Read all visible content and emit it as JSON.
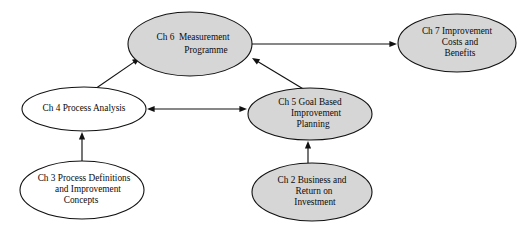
{
  "diagram": {
    "background_color": "#ffffff",
    "filled_color": "#d6d6d6",
    "unfilled_color": "#ffffff",
    "stroke_color": "#111111",
    "nodes": [
      {
        "id": "ch6",
        "name": "ch6-measurement-programme",
        "fill": "filled",
        "cx": 190,
        "cy": 44,
        "rx": 62,
        "ry": 32,
        "lines": [
          "Ch 6  Measurement",
          "Programme"
        ],
        "line_offsets": [
          -6,
          7
        ],
        "line_anchors": [
          193,
          206
        ]
      },
      {
        "id": "ch7",
        "name": "ch7-improvement-costs-and-benefits",
        "fill": "filled",
        "cx": 457,
        "cy": 43,
        "rx": 59,
        "ry": 29,
        "lines": [
          "Ch 7 Improvement",
          "Costs and",
          "Benefits"
        ],
        "line_offsets": [
          -11,
          0,
          11
        ],
        "line_anchors": [
          457,
          460,
          460
        ]
      },
      {
        "id": "ch4",
        "name": "ch4-process-analysis",
        "fill": "unfilled",
        "cx": 84,
        "cy": 109,
        "rx": 62,
        "ry": 22,
        "lines": [
          "Ch 4 Process Analysis"
        ],
        "line_offsets": [
          0
        ],
        "line_anchors": [
          84
        ]
      },
      {
        "id": "ch5",
        "name": "ch5-goal-based-improvement-planning",
        "fill": "filled",
        "cx": 310,
        "cy": 114,
        "rx": 62,
        "ry": 26,
        "lines": [
          "Ch 5 Goal Based",
          "Improvement",
          "Planning"
        ],
        "line_offsets": [
          -11,
          0,
          11
        ],
        "line_anchors": [
          310,
          316,
          313
        ]
      },
      {
        "id": "ch3",
        "name": "ch3-process-definitions-and-improvement-concepts",
        "fill": "unfilled",
        "cx": 82,
        "cy": 190,
        "rx": 62,
        "ry": 29,
        "lines": [
          "Ch 3 Process Definitions",
          "and Improvement",
          "Concepts"
        ],
        "line_offsets": [
          -11,
          0,
          11
        ],
        "line_anchors": [
          84,
          88,
          81
        ]
      },
      {
        "id": "ch2",
        "name": "ch2-business-and-return-on-investment",
        "fill": "filled",
        "cx": 312,
        "cy": 192,
        "rx": 60,
        "ry": 29,
        "lines": [
          "Ch 2 Business and",
          "Return on",
          "Investment"
        ],
        "line_offsets": [
          -11,
          0,
          11
        ],
        "line_anchors": [
          312,
          314,
          315
        ]
      }
    ],
    "edges": [
      {
        "id": "edge-ch4-to-ch6",
        "name": "edge-ch4-to-ch6",
        "from": "ch4",
        "to": "ch6",
        "arrows": "end",
        "x1": 92,
        "y1": 91,
        "x2": 140,
        "y2": 58
      },
      {
        "id": "edge-ch6-to-ch7",
        "name": "edge-ch6-to-ch7",
        "from": "ch6",
        "to": "ch7",
        "arrows": "end",
        "x1": 252,
        "y1": 44,
        "x2": 397,
        "y2": 44
      },
      {
        "id": "edge-ch5-to-ch6",
        "name": "edge-ch5-to-ch6",
        "from": "ch5",
        "to": "ch6",
        "arrows": "end",
        "x1": 305,
        "y1": 90,
        "x2": 252,
        "y2": 58
      },
      {
        "id": "edge-ch4-ch5",
        "name": "edge-ch4-to-ch5-bidirectional",
        "from": "ch4",
        "to": "ch5",
        "arrows": "both",
        "x1": 147,
        "y1": 109,
        "x2": 247,
        "y2": 109
      },
      {
        "id": "edge-ch3-to-ch4",
        "name": "edge-ch3-to-ch4",
        "from": "ch3",
        "to": "ch4",
        "arrows": "end",
        "x1": 82,
        "y1": 161,
        "x2": 82,
        "y2": 132
      },
      {
        "id": "edge-ch2-to-ch5",
        "name": "edge-ch2-to-ch5",
        "from": "ch2",
        "to": "ch5",
        "arrows": "end",
        "x1": 308,
        "y1": 163,
        "x2": 308,
        "y2": 141
      }
    ]
  }
}
